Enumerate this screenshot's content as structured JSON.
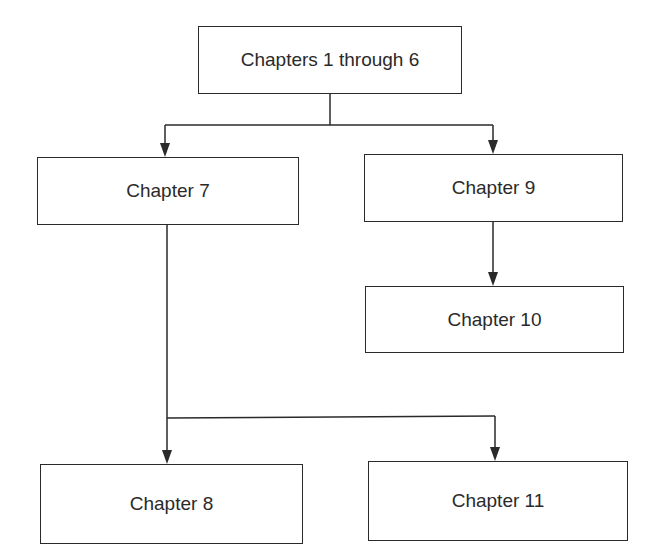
{
  "diagram": {
    "type": "flowchart",
    "nodes": [
      {
        "id": "ch1_6",
        "label": "Chapters 1 through 6"
      },
      {
        "id": "ch7",
        "label": "Chapter 7"
      },
      {
        "id": "ch9",
        "label": "Chapter 9"
      },
      {
        "id": "ch10",
        "label": "Chapter 10"
      },
      {
        "id": "ch8",
        "label": "Chapter 8"
      },
      {
        "id": "ch11",
        "label": "Chapter 11"
      }
    ],
    "edges": [
      {
        "from": "ch1_6",
        "to": "ch7"
      },
      {
        "from": "ch1_6",
        "to": "ch9"
      },
      {
        "from": "ch9",
        "to": "ch10"
      },
      {
        "from": "ch7",
        "to": "ch8"
      },
      {
        "from": "ch7",
        "to": "ch11"
      }
    ],
    "colors": {
      "stroke": "#2a2a2a",
      "background": "#ffffff"
    }
  }
}
